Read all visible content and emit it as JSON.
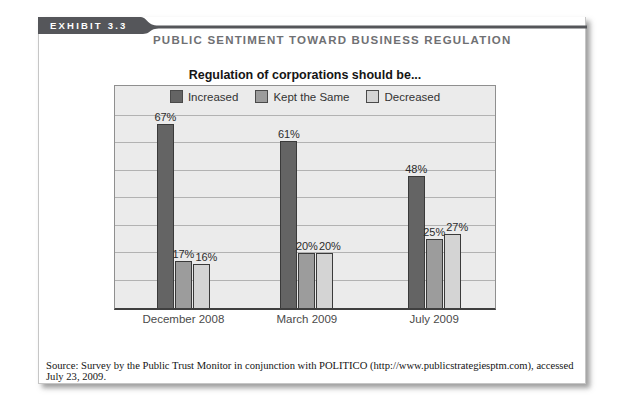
{
  "exhibit": {
    "label": "EXHIBIT 3.3",
    "title": "PUBLIC SENTIMENT TOWARD BUSINESS REGULATION"
  },
  "chart_data": {
    "type": "bar",
    "title": "Regulation of corporations should be...",
    "categories": [
      "December 2008",
      "March 2009",
      "July 2009"
    ],
    "series": [
      {
        "name": "Increased",
        "color": "#646464",
        "values": [
          67,
          61,
          48
        ]
      },
      {
        "name": "Kept the Same",
        "color": "#9c9c9c",
        "values": [
          17,
          20,
          25
        ]
      },
      {
        "name": "Decreased",
        "color": "#d4d4d4",
        "values": [
          16,
          20,
          27
        ]
      }
    ],
    "value_suffix": "%",
    "ylim": [
      0,
      70
    ],
    "grid_step": 10,
    "grid": true,
    "legend_position": "top-inside",
    "plot_bg": "#ebebeb",
    "grid_color": "#b2b2b2",
    "accent_dark": "#55565a",
    "xlabel": "",
    "ylabel": ""
  },
  "source": {
    "text": "Source: Survey by the Public Trust Monitor in conjunction with POLITICO (http://www.publicstrategiesptm.com), accessed July 23, 2009."
  }
}
